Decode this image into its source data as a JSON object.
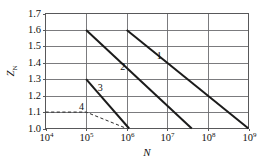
{
  "chart_data": {
    "type": "line",
    "title": "",
    "xlabel": "N",
    "ylabel": "Z",
    "ylabel_sub": "N",
    "xscale": "log",
    "yscale": "linear",
    "xlim": [
      10000,
      1000000000
    ],
    "ylim": [
      1.0,
      1.7
    ],
    "grid": true,
    "legend_position": "inline-labels",
    "xticks": [
      {
        "value": 10000,
        "base": "10",
        "exponent": "4",
        "label": "10⁴"
      },
      {
        "value": 100000,
        "base": "10",
        "exponent": "5",
        "label": "10⁵"
      },
      {
        "value": 1000000,
        "base": "10",
        "exponent": "6",
        "label": "10⁶"
      },
      {
        "value": 10000000,
        "base": "10",
        "exponent": "7",
        "label": "10⁷"
      },
      {
        "value": 100000000,
        "base": "10",
        "exponent": "8",
        "label": "10⁸"
      },
      {
        "value": 1000000000,
        "base": "10",
        "exponent": "9",
        "label": "10⁹"
      }
    ],
    "yticks": [
      {
        "value": 1.0,
        "label": "1.0"
      },
      {
        "value": 1.1,
        "label": "1.1"
      },
      {
        "value": 1.2,
        "label": "1.2"
      },
      {
        "value": 1.3,
        "label": "1.3"
      },
      {
        "value": 1.4,
        "label": "1.4"
      },
      {
        "value": 1.5,
        "label": "1.5"
      },
      {
        "value": 1.6,
        "label": "1.6"
      },
      {
        "value": 1.7,
        "label": "1.7"
      }
    ],
    "series": [
      {
        "name": "1",
        "label": "1",
        "style": "solid",
        "color": "#1b1b1b",
        "points": [
          {
            "x": 1000000,
            "y": 1.6
          },
          {
            "x": 1000000000,
            "y": 1.0
          }
        ],
        "label_point": {
          "x": 6300000,
          "y": 1.435
        }
      },
      {
        "name": "2",
        "label": "2",
        "style": "solid",
        "color": "#1b1b1b",
        "points": [
          {
            "x": 100000,
            "y": 1.6
          },
          {
            "x": 40000000,
            "y": 1.0
          }
        ],
        "label_point": {
          "x": 800000,
          "y": 1.372
        }
      },
      {
        "name": "3",
        "label": "3",
        "style": "solid",
        "color": "#1b1b1b",
        "points": [
          {
            "x": 100000,
            "y": 1.3
          },
          {
            "x": 1150000,
            "y": 1.0
          }
        ],
        "label_point": {
          "x": 224000,
          "y": 1.243
        }
      },
      {
        "name": "4",
        "label": "4",
        "style": "dashed",
        "color": "#2b2b2b",
        "points": [
          {
            "x": 10000,
            "y": 1.1
          },
          {
            "x": 100000,
            "y": 1.1
          },
          {
            "x": 1000000,
            "y": 1.0
          }
        ],
        "label_point": {
          "x": 77000,
          "y": 1.125
        }
      }
    ]
  }
}
